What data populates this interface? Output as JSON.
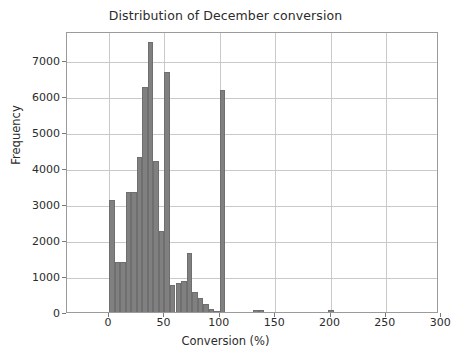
{
  "chart_data": {
    "type": "bar",
    "title": "Distribution of December conversion",
    "xlabel": "Conversion (%)",
    "ylabel": "Frequency",
    "xlim": [
      -38,
      298
    ],
    "ylim": [
      0,
      7800
    ],
    "grid": true,
    "legend": null,
    "bin_width": 5,
    "bar_color": "#808080",
    "xticks": [
      0,
      50,
      100,
      150,
      200,
      250,
      300
    ],
    "xtick_labels": [
      "0",
      "50",
      "100",
      "150",
      "200",
      "250",
      "300"
    ],
    "yticks": [
      0,
      1000,
      2000,
      3000,
      4000,
      5000,
      6000,
      7000
    ],
    "ytick_labels": [
      "0",
      "1000",
      "2000",
      "3000",
      "4000",
      "5000",
      "6000",
      "7000"
    ],
    "bins": [
      {
        "x0": 0,
        "x1": 5,
        "value": 3120
      },
      {
        "x0": 5,
        "x1": 10,
        "value": 1400
      },
      {
        "x0": 10,
        "x1": 15,
        "value": 1400
      },
      {
        "x0": 15,
        "x1": 20,
        "value": 3340
      },
      {
        "x0": 20,
        "x1": 25,
        "value": 3340
      },
      {
        "x0": 25,
        "x1": 30,
        "value": 4310
      },
      {
        "x0": 30,
        "x1": 35,
        "value": 6240
      },
      {
        "x0": 35,
        "x1": 40,
        "value": 7500
      },
      {
        "x0": 40,
        "x1": 45,
        "value": 4180
      },
      {
        "x0": 45,
        "x1": 50,
        "value": 2240
      },
      {
        "x0": 50,
        "x1": 55,
        "value": 6670
      },
      {
        "x0": 55,
        "x1": 60,
        "value": 760
      },
      {
        "x0": 60,
        "x1": 65,
        "value": 800
      },
      {
        "x0": 65,
        "x1": 70,
        "value": 870
      },
      {
        "x0": 70,
        "x1": 75,
        "value": 1630
      },
      {
        "x0": 75,
        "x1": 80,
        "value": 560
      },
      {
        "x0": 80,
        "x1": 85,
        "value": 390
      },
      {
        "x0": 85,
        "x1": 90,
        "value": 220
      },
      {
        "x0": 90,
        "x1": 95,
        "value": 90
      },
      {
        "x0": 95,
        "x1": 100,
        "value": 40
      },
      {
        "x0": 100,
        "x1": 105,
        "value": 6150
      },
      {
        "x0": 130,
        "x1": 135,
        "value": 45
      },
      {
        "x0": 135,
        "x1": 140,
        "value": 45
      },
      {
        "x0": 198,
        "x1": 203,
        "value": 55
      }
    ]
  },
  "chart": {
    "title": "Distribution of December conversion",
    "xlabel": "Conversion (%)",
    "ylabel": "Frequency"
  }
}
